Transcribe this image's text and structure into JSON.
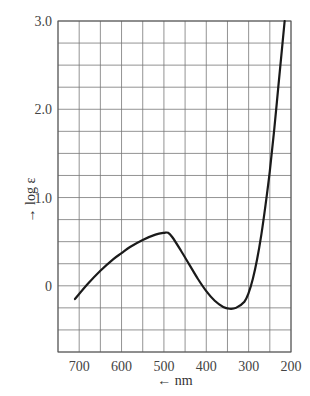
{
  "chart_data": {
    "type": "line",
    "title": "",
    "xlabel": "← nm",
    "ylabel": "→ log ε",
    "xlim": [
      750,
      200
    ],
    "ylim": [
      -0.75,
      3.0
    ],
    "x_reversed": true,
    "grid": true,
    "x_ticks": [
      700,
      600,
      500,
      400,
      300,
      200
    ],
    "x_tick_labels": [
      "700",
      "600",
      "500",
      "400",
      "300",
      "200"
    ],
    "y_ticks": [
      0,
      1.0,
      2.0,
      3.0
    ],
    "y_tick_labels": [
      "0",
      "1.0",
      "2.0",
      "3.0"
    ],
    "x_grid_step": 50,
    "y_grid_step": 0.25,
    "series": [
      {
        "name": "absorption spectrum",
        "x": [
          710,
          680,
          650,
          620,
          600,
          580,
          550,
          520,
          500,
          490,
          480,
          460,
          440,
          420,
          400,
          380,
          360,
          345,
          330,
          310,
          300,
          290,
          280,
          270,
          260,
          250,
          240,
          230,
          220,
          215
        ],
        "y": [
          -0.15,
          0.02,
          0.17,
          0.3,
          0.37,
          0.44,
          0.52,
          0.58,
          0.6,
          0.6,
          0.55,
          0.4,
          0.24,
          0.08,
          -0.06,
          -0.17,
          -0.24,
          -0.26,
          -0.25,
          -0.18,
          -0.08,
          0.08,
          0.3,
          0.58,
          0.92,
          1.3,
          1.75,
          2.25,
          2.75,
          3.0
        ]
      }
    ]
  },
  "labels": {
    "y_axis": "→ log ε",
    "x_axis": "← nm"
  }
}
